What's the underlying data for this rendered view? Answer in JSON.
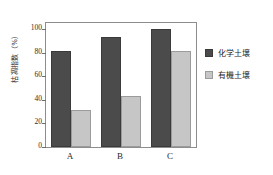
{
  "chart_data": {
    "type": "bar",
    "title": "",
    "xlabel": "",
    "ylabel": "枯凋指数（%）",
    "categories": [
      "A",
      "B",
      "C"
    ],
    "series": [
      {
        "name": "化学土壌",
        "values": [
          81,
          93,
          100
        ],
        "color": "#4b4b4b"
      },
      {
        "name": "有機土壌",
        "values": [
          31,
          43,
          81
        ],
        "color": "#c6c6c6"
      }
    ],
    "ylim": [
      0,
      105
    ],
    "yticks": [
      0,
      20,
      40,
      60,
      80,
      100
    ],
    "ytick_labels": [
      "0",
      "20",
      "40",
      "60",
      "80",
      "100"
    ],
    "grid": false,
    "legend_position": "right"
  },
  "legend": {
    "items": [
      {
        "label": "化学土壌",
        "swatch": "dark-square-swatch"
      },
      {
        "label": "有機土壌",
        "swatch": "light-square-swatch"
      }
    ]
  }
}
